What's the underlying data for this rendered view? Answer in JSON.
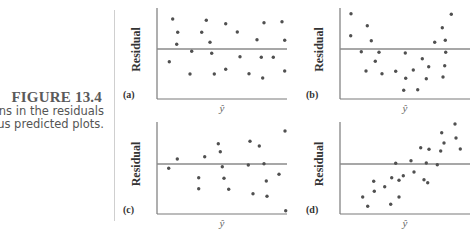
{
  "figure": {
    "title": "FIGURE 13.4",
    "caption_lines": [
      "terns in the residuals",
      "ersus predicted plots."
    ]
  },
  "colors": {
    "axis": "#7a7a7a",
    "point": "#505050",
    "title": "#5a5a5a"
  },
  "chart_data": [
    {
      "type": "scatter",
      "panel": "(a)",
      "title": "",
      "xlabel": "ŷ",
      "ylabel": "Residual",
      "description": "Random scatter around zero (no pattern)",
      "grid": false,
      "reference_line": 0,
      "box": {
        "x0": 157,
        "x1": 287,
        "y_top": 8,
        "y_bottom": 99,
        "y_zero": 49
      },
      "points_px": [
        [
          172.7,
          19
        ],
        [
          177.7,
          32.3
        ],
        [
          176.7,
          44.3
        ],
        [
          169.3,
          61.7
        ],
        [
          190,
          74
        ],
        [
          191.7,
          51.3
        ],
        [
          201.7,
          32.3
        ],
        [
          206.3,
          20.3
        ],
        [
          210,
          42.3
        ],
        [
          211.7,
          53.3
        ],
        [
          214.3,
          74
        ],
        [
          225.7,
          23.7
        ],
        [
          225.7,
          69.3
        ],
        [
          237.3,
          32
        ],
        [
          240,
          56.7
        ],
        [
          249,
          73.7
        ],
        [
          257,
          39.7
        ],
        [
          261.3,
          57.3
        ],
        [
          262.7,
          78
        ],
        [
          264,
          22.7
        ],
        [
          273.3,
          57.3
        ],
        [
          282,
          21.7
        ],
        [
          284.7,
          40.3
        ],
        [
          284.7,
          71
        ]
      ]
    },
    {
      "type": "scatter",
      "panel": "(b)",
      "title": "",
      "xlabel": "ŷ",
      "ylabel": "Residual",
      "description": "Curved (U-shaped) pattern",
      "grid": false,
      "reference_line": 0,
      "box": {
        "x0": 340,
        "x1": 470,
        "y_top": 8,
        "y_bottom": 99,
        "y_zero": 49
      },
      "points_px": [
        [
          351,
          13.7
        ],
        [
          350.7,
          35.7
        ],
        [
          367.3,
          25.7
        ],
        [
          371.3,
          40.7
        ],
        [
          361.3,
          51.7
        ],
        [
          379,
          52.3
        ],
        [
          375.3,
          61.3
        ],
        [
          366,
          71
        ],
        [
          382,
          73.7
        ],
        [
          395.7,
          71.3
        ],
        [
          405.3,
          53
        ],
        [
          405.7,
          78.3
        ],
        [
          403.7,
          90.3
        ],
        [
          413.3,
          70
        ],
        [
          417.7,
          89.7
        ],
        [
          422.3,
          58.7
        ],
        [
          426.3,
          78.7
        ],
        [
          428.7,
          66.7
        ],
        [
          434.7,
          42.3
        ],
        [
          442.3,
          27.7
        ],
        [
          445.3,
          40.3
        ],
        [
          445.7,
          52.3
        ],
        [
          444.7,
          65.7
        ],
        [
          443,
          77
        ],
        [
          451.3,
          14.3
        ]
      ]
    },
    {
      "type": "scatter",
      "panel": "(c)",
      "title": "",
      "xlabel": "ŷ",
      "ylabel": "Residual",
      "description": "Fan-shaped pattern (increasing spread)",
      "grid": false,
      "reference_line": 0,
      "box": {
        "x0": 157,
        "x1": 287,
        "y_top": 122,
        "y_bottom": 214,
        "y_zero": 164
      },
      "points_px": [
        [
          168.7,
          168.3
        ],
        [
          177.3,
          159
        ],
        [
          198.7,
          177.7
        ],
        [
          198.7,
          188.7
        ],
        [
          204.7,
          156.7
        ],
        [
          218.3,
          143.7
        ],
        [
          220.3,
          151.7
        ],
        [
          222.3,
          166.7
        ],
        [
          224,
          178.3
        ],
        [
          228.7,
          189.3
        ],
        [
          248.3,
          165
        ],
        [
          250,
          141.3
        ],
        [
          253,
          193.7
        ],
        [
          259.3,
          146
        ],
        [
          264,
          163.7
        ],
        [
          266.3,
          181
        ],
        [
          267,
          196.3
        ],
        [
          279,
          174.3
        ],
        [
          285,
          131
        ],
        [
          285.7,
          210.7
        ]
      ]
    },
    {
      "type": "scatter",
      "panel": "(d)",
      "title": "",
      "xlabel": "ŷ",
      "ylabel": "Residual",
      "description": "Linear increasing trend",
      "grid": false,
      "reference_line": 0,
      "box": {
        "x0": 340,
        "x1": 470,
        "y_top": 122,
        "y_bottom": 214,
        "y_zero": 164
      },
      "points_px": [
        [
          362.7,
          197
        ],
        [
          367.7,
          206.3
        ],
        [
          373.7,
          181.3
        ],
        [
          374.3,
          191.3
        ],
        [
          384.7,
          186.7
        ],
        [
          391.7,
          177.7
        ],
        [
          390.7,
          204.3
        ],
        [
          399,
          180.3
        ],
        [
          399,
          197
        ],
        [
          395.7,
          163.3
        ],
        [
          403.3,
          175.7
        ],
        [
          411,
          160.7
        ],
        [
          414,
          172
        ],
        [
          420.7,
          147.7
        ],
        [
          424,
          179.7
        ],
        [
          427.7,
          182.7
        ],
        [
          426.3,
          163
        ],
        [
          429,
          149.3
        ],
        [
          437.3,
          164.7
        ],
        [
          440.7,
          151
        ],
        [
          441.7,
          132.7
        ],
        [
          444,
          143
        ],
        [
          455,
          124
        ],
        [
          456,
          138
        ],
        [
          460.3,
          149
        ]
      ]
    }
  ]
}
